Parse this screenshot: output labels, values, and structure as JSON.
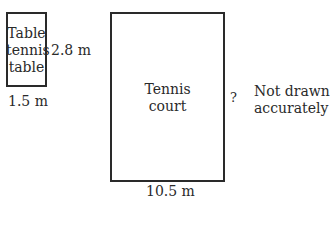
{
  "table_tennis": {
    "label_lines": [
      "Table",
      "tennis",
      "table"
    ],
    "height_label": "2.8 m",
    "width_label": "1.5 m"
  },
  "tennis_court": {
    "label_lines": [
      "Tennis",
      "court"
    ],
    "height_label": "?",
    "width_label": "10.5 m"
  },
  "note": {
    "lines": [
      "Not drawn",
      "accurately"
    ]
  }
}
